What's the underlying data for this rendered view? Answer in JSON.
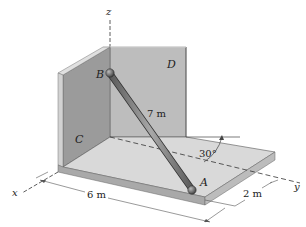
{
  "figure": {
    "axes": {
      "x": "x",
      "y": "y",
      "z": "z"
    },
    "points": {
      "A": "A",
      "B": "B"
    },
    "walls": {
      "C": "C",
      "D": "D"
    },
    "dimensions": {
      "rod_length": "7 m",
      "x_dimension": "6 m",
      "y_offset": "2 m",
      "angle": "30°"
    },
    "colors": {
      "wall_left": "#9a9a9a",
      "wall_left_edge": "#c8c8c8",
      "wall_back": "#b9b9b9",
      "floor_top": "#d6d6d6",
      "floor_edge": "#a8a8a8",
      "rod": "#7a7a7a",
      "ink": "#333333"
    }
  }
}
